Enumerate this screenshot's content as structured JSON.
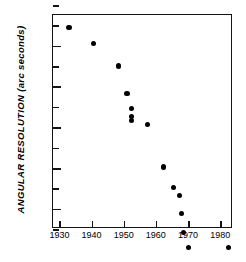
{
  "chart_data": {
    "type": "scatter",
    "title": "",
    "xlabel": "",
    "ylabel": "ANGULAR RESOLUTION (arc seconds)",
    "yscale": "log",
    "xscale": "linear",
    "xlim": [
      1928,
      1984
    ],
    "ylim": [
      1e-05,
      320000.0
    ],
    "grid": false,
    "legend": null,
    "xticks": [
      1930,
      1940,
      1950,
      1960,
      1970,
      1980
    ],
    "xticklabels": [
      "1930",
      "1940",
      "1950",
      "1960",
      "1970",
      "1980"
    ],
    "yticks": [
      10000,
      100,
      1,
      0.01,
      0.0001
    ],
    "yticklabels": [
      "10⁴",
      "10²",
      "1",
      "10⁻²",
      "10⁻⁴"
    ],
    "ytick_mantissa": [
      "10",
      "10",
      "1",
      "10",
      "10"
    ],
    "ytick_exponent": [
      "4",
      "2",
      "",
      "-2",
      "-4"
    ],
    "yminorticks": [
      1000000,
      100000,
      1000,
      10,
      0.1,
      0.001,
      1e-05
    ],
    "points": [
      {
        "x": 1933.0,
        "y": 80000
      },
      {
        "x": 1940.5,
        "y": 13000
      },
      {
        "x": 1948.5,
        "y": 1000
      },
      {
        "x": 1951.0,
        "y": 45
      },
      {
        "x": 1952.3,
        "y": 8.0
      },
      {
        "x": 1952.4,
        "y": 3.2
      },
      {
        "x": 1952.5,
        "y": 2.2
      },
      {
        "x": 1957.3,
        "y": 1.3
      },
      {
        "x": 1962.5,
        "y": 0.011
      },
      {
        "x": 1965.5,
        "y": 0.0011
      },
      {
        "x": 1967.3,
        "y": 0.00045
      },
      {
        "x": 1968.0,
        "y": 6e-05
      },
      {
        "x": 1968.7,
        "y": 6.5e-06
      },
      {
        "x": 1970.2,
        "y": 1.2e-06
      },
      {
        "x": 1982.7,
        "y": 1.2e-06
      }
    ]
  },
  "axes": {
    "y_axis_title": "ANGULAR RESOLUTION (arc seconds)"
  }
}
